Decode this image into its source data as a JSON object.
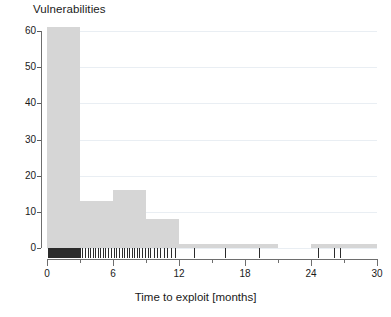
{
  "chart_data": {
    "type": "bar",
    "title": "Vulnerabilities",
    "subtitle": "",
    "xlabel": "Time to exploit [months]",
    "ylabel": "",
    "xlim": [
      0,
      30
    ],
    "ylim": [
      0,
      61
    ],
    "grid": true,
    "legend": null,
    "bin_width": 3,
    "bin_edges": [
      0,
      3,
      6,
      9,
      12,
      15,
      18,
      21,
      24,
      27,
      30
    ],
    "categories": [
      "0-3",
      "3-6",
      "6-9",
      "9-12",
      "12-15",
      "15-18",
      "18-21",
      "21-24",
      "24-27",
      "27-30"
    ],
    "values": [
      61,
      13,
      16,
      8,
      1,
      1,
      1,
      0,
      1,
      1
    ],
    "bars": [
      {
        "x0": 0,
        "x1": 3,
        "value": 61
      },
      {
        "x0": 3,
        "x1": 6,
        "value": 13
      },
      {
        "x0": 6,
        "x1": 9,
        "value": 16
      },
      {
        "x0": 9,
        "x1": 12,
        "value": 8
      },
      {
        "x0": 12,
        "x1": 15,
        "value": 1
      },
      {
        "x0": 15,
        "x1": 18,
        "value": 1
      },
      {
        "x0": 18,
        "x1": 21,
        "value": 1
      },
      {
        "x0": 21,
        "x1": 24,
        "value": 0
      },
      {
        "x0": 24,
        "x1": 27,
        "value": 1
      },
      {
        "x0": 27,
        "x1": 30,
        "value": 1
      }
    ],
    "xticks": [
      0,
      6,
      12,
      18,
      24,
      30
    ],
    "xtick_labels": [
      "0",
      "6",
      "12",
      "18",
      "24",
      "30"
    ],
    "xticks_minor": [
      3,
      9,
      15,
      21,
      27
    ],
    "yticks": [
      0,
      10,
      20,
      30,
      40,
      50,
      60
    ],
    "ytick_labels": [
      "0",
      "10",
      "20",
      "30",
      "40",
      "50",
      "60"
    ],
    "rug_values": [
      0.1,
      0.18,
      0.25,
      0.3,
      0.34,
      0.4,
      0.46,
      0.52,
      0.58,
      0.63,
      0.7,
      0.76,
      0.82,
      0.88,
      0.95,
      1.02,
      1.08,
      1.15,
      1.22,
      1.28,
      1.35,
      1.42,
      1.5,
      1.58,
      1.66,
      1.74,
      1.82,
      1.9,
      1.98,
      2.06,
      2.15,
      2.24,
      2.33,
      2.42,
      2.52,
      2.62,
      2.72,
      2.82,
      2.92,
      3.0,
      3.2,
      3.45,
      3.7,
      3.95,
      4.2,
      4.4,
      4.6,
      4.85,
      5.05,
      5.3,
      5.55,
      5.8,
      6.05,
      6.3,
      6.55,
      6.8,
      7.0,
      7.25,
      7.45,
      7.7,
      7.95,
      8.15,
      8.4,
      8.65,
      8.9,
      9.15,
      9.4,
      9.7,
      10.0,
      10.3,
      10.6,
      10.95,
      11.3,
      11.65,
      13.4,
      16.2,
      19.3,
      24.6,
      26.1,
      26.6
    ],
    "colors": {
      "bar_fill": "#d6d6d6",
      "grid": "#e9eef3",
      "axis": "#6e6e6e",
      "rug": "#2b2b2b",
      "text": "#1a1a1a",
      "background": "#ffffff"
    }
  }
}
